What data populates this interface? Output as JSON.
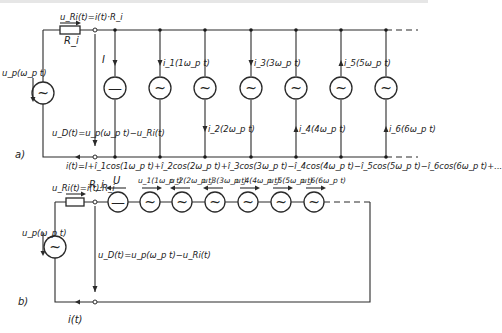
{
  "figure": {
    "part_a": {
      "label": "a)",
      "source_voltage": "u_p(ω_p t)",
      "resistor_voltage": "u_Ri(t)=i(t)·R_i",
      "resistor_name": "R_i",
      "diode_voltage": "u_D(t)=u_p(ω_p t)−u_Ri(t)",
      "dc_current": "I",
      "harmonic_currents": [
        {
          "label": "i_1(1ω_p t)",
          "direction": "down",
          "position": "above"
        },
        {
          "label": "i_2(2ω_p t)",
          "direction": "down",
          "position": "below"
        },
        {
          "label": "i_3(3ω_p t)",
          "direction": "down",
          "position": "above"
        },
        {
          "label": "i_4(4ω_p t)",
          "direction": "up",
          "position": "below"
        },
        {
          "label": "i_5(5ω_p t)",
          "direction": "up",
          "position": "above"
        },
        {
          "label": "i_6(6ω_p t)",
          "direction": "up",
          "position": "below"
        }
      ],
      "series_expression": "i(t)=I+î_1cos(1ω_p t)+î_2cos(2ω_p t)+î_3cos(3ω_p t)−î_4cos(4ω_p t)−î_5cos(5ω_p t)−î_6cos(6ω_p t)+..."
    },
    "part_b": {
      "label": "b)",
      "source_voltage": "u_p(ω_p t)",
      "resistor_voltage": "u_Ri(t)=i(t)·R_i",
      "resistor_name": "R_i",
      "diode_voltage": "u_D(t)=u_p(ω_p t)−u_Ri(t)",
      "current": "i(t)",
      "dc_voltage": "U",
      "harmonic_voltages": [
        {
          "label": "u_1(1ω_p t)",
          "direction": "right"
        },
        {
          "label": "u_2(2ω_p t)",
          "direction": "left"
        },
        {
          "label": "u_3(3ω_p t)",
          "direction": "left"
        },
        {
          "label": "u_4(4ω_p t)",
          "direction": "right"
        },
        {
          "label": "u_5(5ω_p t)",
          "direction": "right"
        },
        {
          "label": "u_6(6ω_p t)",
          "direction": "right"
        }
      ]
    },
    "glyphs": {
      "ac": "~",
      "dc": "—"
    },
    "colors": {
      "line": "#2a2a2a",
      "background": "#ffffff"
    }
  }
}
